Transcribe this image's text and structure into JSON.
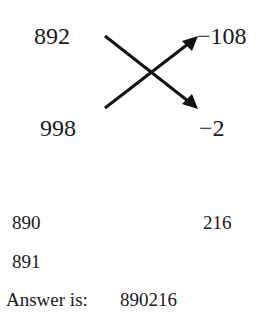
{
  "diagram": {
    "top_left": "892",
    "bottom_left": "998",
    "top_right": "−108",
    "bottom_right": "−2",
    "arrows": [
      {
        "from": "892",
        "to": "−2"
      },
      {
        "from": "998",
        "to": "−108"
      }
    ]
  },
  "work": {
    "row1_left": "890",
    "row1_right": "216",
    "row2_left": "891"
  },
  "answer": {
    "label": "Answer is:",
    "value": "890216"
  }
}
